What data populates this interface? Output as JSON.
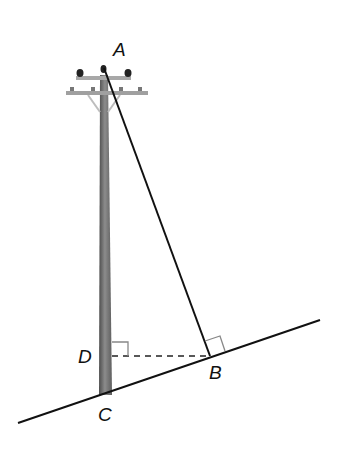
{
  "labels": {
    "A": "A",
    "B": "B",
    "C": "C",
    "D": "D"
  },
  "points": {
    "A": [
      104,
      68
    ],
    "B": [
      210,
      356
    ],
    "C": [
      106,
      393
    ],
    "D": [
      111,
      356
    ]
  },
  "colors": {
    "line": "#111111",
    "pole_dark": "#5a5a5a",
    "pole_light": "#9a9a9a",
    "crossarm": "#a8a8a8",
    "right_angle_mark": "#888888"
  },
  "elements": {
    "ground_line": "sloped ground line from lower-left to upper-right",
    "pole": "utility pole standing vertically from C up to A",
    "guy_wire": "straight wire from top of pole A to ground point B",
    "dashed_segment": "horizontal dashed segment DB",
    "right_angle_D": "right angle marker at D between pole and DB",
    "right_angle_B": "right angle marker at B between wire AB and ground"
  }
}
